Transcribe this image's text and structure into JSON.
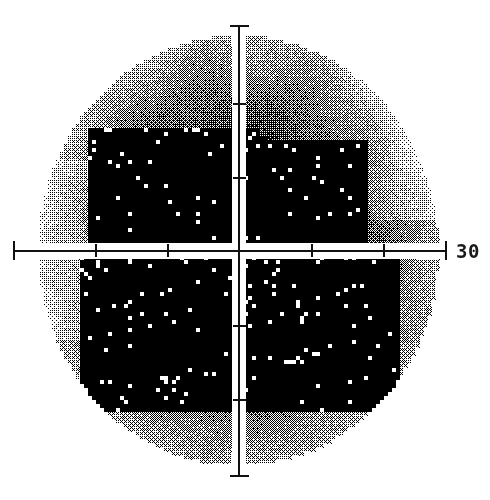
{
  "plot": {
    "title": "Visual Field Grayscale Plot",
    "type": "grayscale-perimetry",
    "axis_label_right": "30",
    "axis_unit": "degrees",
    "center_x": 239,
    "center_y": 251,
    "degrees_per_tick": 10,
    "pixels_per_tick": 72,
    "field_radius_deg": 30
  },
  "axes": {
    "horizontal": {
      "name": "horizontal-meridian",
      "x_start": 13,
      "x_end": 446,
      "y": 250
    },
    "vertical": {
      "name": "vertical-meridian",
      "y_start": 25,
      "y_end": 476,
      "x": 239
    },
    "h_ticks": [
      13,
      95,
      167,
      311,
      383,
      445
    ],
    "v_ticks": [
      25,
      103,
      177,
      325,
      399,
      475
    ]
  },
  "chart_data": {
    "type": "heatmap",
    "xlabel": "",
    "ylabel": "",
    "xlim": [
      -30,
      30
    ],
    "ylim": [
      -30,
      30
    ],
    "grid": false,
    "legend_position": "none",
    "annotations": [
      "30"
    ],
    "gray_levels": [
      {
        "name": "white",
        "hex": "#ffffff",
        "density": 0.0,
        "meaning": "normal sensitivity"
      },
      {
        "name": "light-lattice",
        "hex": "#e0e0e0",
        "density": 0.3,
        "meaning": "mild depression"
      },
      {
        "name": "mid-lattice",
        "hex": "#9a9a9a",
        "density": 0.5,
        "meaning": "moderate depression"
      },
      {
        "name": "checker",
        "hex": "#6a6a6a",
        "density": 0.62,
        "meaning": "marked depression"
      },
      {
        "name": "dark-dither",
        "hex": "#2e2e2e",
        "density": 0.85,
        "meaning": "severe depression"
      },
      {
        "name": "black",
        "hex": "#000000",
        "density": 1.0,
        "meaning": "absolute defect"
      }
    ]
  }
}
